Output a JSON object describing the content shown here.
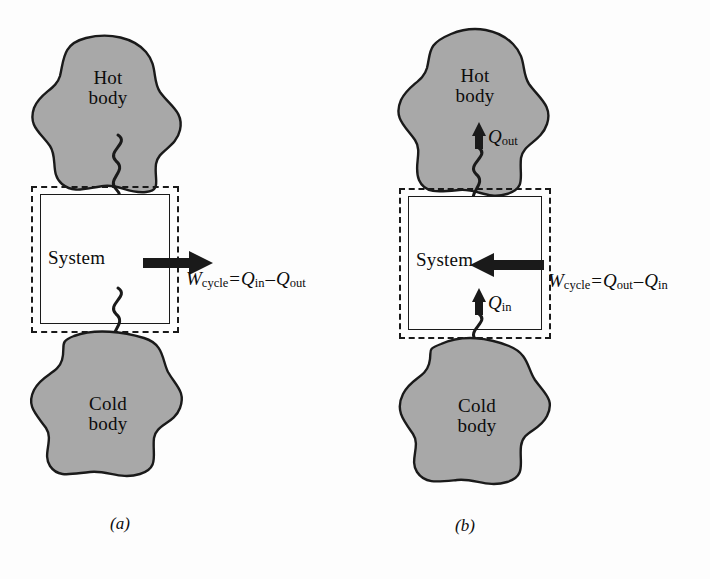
{
  "figure": {
    "title_visible": false,
    "background_color": "#fdfdfd",
    "blob_fill_color": "#a8a8a8",
    "blob_stroke_color": "#1a1a1a",
    "line_color": "#1a1a1a"
  },
  "panels": [
    {
      "id": "a",
      "caption": "(a)",
      "hot_body_label": "Hot\nbody",
      "cold_body_label": "Cold\nbody",
      "system_label": "System",
      "heat_in": {
        "symbol": "Q",
        "subscript": "in",
        "direction": "down",
        "location": "top"
      },
      "heat_out": {
        "symbol": "Q",
        "subscript": "out",
        "direction": "down",
        "location": "bottom"
      },
      "work": {
        "symbol": "W",
        "subscript": "cycle",
        "direction": "right",
        "equation_plain": "W_cycle = Q_in - Q_out",
        "equals": "=",
        "minus": "–",
        "term1": {
          "symbol": "Q",
          "subscript": "in"
        },
        "term2": {
          "symbol": "Q",
          "subscript": "out"
        }
      }
    },
    {
      "id": "b",
      "caption": "(b)",
      "hot_body_label": "Hot\nbody",
      "cold_body_label": "Cold\nbody",
      "system_label": "System",
      "heat_out": {
        "symbol": "Q",
        "subscript": "out",
        "direction": "up",
        "location": "top"
      },
      "heat_in": {
        "symbol": "Q",
        "subscript": "in",
        "direction": "up",
        "location": "bottom"
      },
      "work": {
        "symbol": "W",
        "subscript": "cycle",
        "direction": "left",
        "equation_plain": "W_cycle = Q_out - Q_in",
        "equals": "=",
        "minus": "–",
        "term1": {
          "symbol": "Q",
          "subscript": "out"
        },
        "term2": {
          "symbol": "Q",
          "subscript": "in"
        }
      }
    }
  ]
}
